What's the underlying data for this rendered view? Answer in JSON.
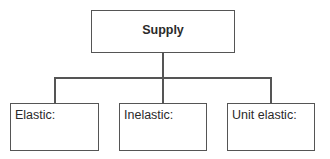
{
  "diagram": {
    "root": {
      "label": "Supply"
    },
    "children": [
      {
        "label": "Elastic:",
        "content": ""
      },
      {
        "label": "Inelastic:",
        "content": ""
      },
      {
        "label": "Unit elastic:",
        "content": ""
      }
    ]
  },
  "colors": {
    "stroke": "#555555",
    "text": "#2a2a2a",
    "background": "#ffffff"
  }
}
